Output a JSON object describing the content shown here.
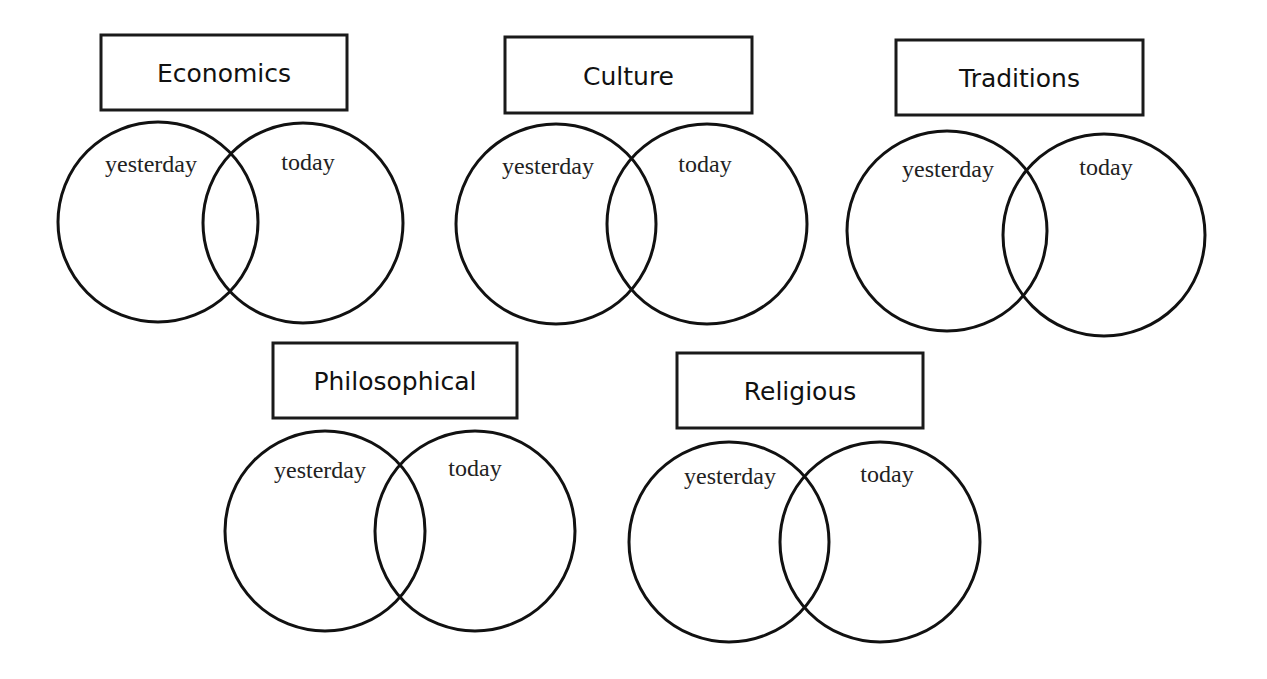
{
  "diagrams": [
    {
      "title": "Economics",
      "left_label": "yesterday",
      "right_label": "today",
      "box": {
        "x": 101,
        "y": 35,
        "w": 246,
        "h": 75
      },
      "left_circle": {
        "cx": 158,
        "cy": 222,
        "r": 100
      },
      "right_circle": {
        "cx": 303,
        "cy": 223,
        "r": 100
      },
      "left_label_pos": {
        "x": 151,
        "y": 172
      },
      "right_label_pos": {
        "x": 308,
        "y": 170
      }
    },
    {
      "title": "Culture",
      "left_label": "yesterday",
      "right_label": "today",
      "box": {
        "x": 505,
        "y": 37,
        "w": 247,
        "h": 76
      },
      "left_circle": {
        "cx": 556,
        "cy": 224,
        "r": 100
      },
      "right_circle": {
        "cx": 707,
        "cy": 224,
        "r": 100
      },
      "left_label_pos": {
        "x": 548,
        "y": 174
      },
      "right_label_pos": {
        "x": 705,
        "y": 172
      }
    },
    {
      "title": "Traditions",
      "left_label": "yesterday",
      "right_label": "today",
      "box": {
        "x": 896,
        "y": 40,
        "w": 247,
        "h": 75
      },
      "left_circle": {
        "cx": 947,
        "cy": 231,
        "r": 100
      },
      "right_circle": {
        "cx": 1104,
        "cy": 235,
        "r": 101
      },
      "left_label_pos": {
        "x": 948,
        "y": 177
      },
      "right_label_pos": {
        "x": 1106,
        "y": 175
      }
    },
    {
      "title": "Philosophical",
      "left_label": "yesterday",
      "right_label": "today",
      "box": {
        "x": 273,
        "y": 343,
        "w": 244,
        "h": 75
      },
      "left_circle": {
        "cx": 325,
        "cy": 531,
        "r": 100
      },
      "right_circle": {
        "cx": 475,
        "cy": 531,
        "r": 100
      },
      "left_label_pos": {
        "x": 320,
        "y": 478
      },
      "right_label_pos": {
        "x": 475,
        "y": 476
      }
    },
    {
      "title": "Religious",
      "left_label": "yesterday",
      "right_label": "today",
      "box": {
        "x": 677,
        "y": 353,
        "w": 246,
        "h": 75
      },
      "left_circle": {
        "cx": 729,
        "cy": 542,
        "r": 100
      },
      "right_circle": {
        "cx": 880,
        "cy": 542,
        "r": 100
      },
      "left_label_pos": {
        "x": 730,
        "y": 484
      },
      "right_label_pos": {
        "x": 887,
        "y": 482
      }
    }
  ]
}
